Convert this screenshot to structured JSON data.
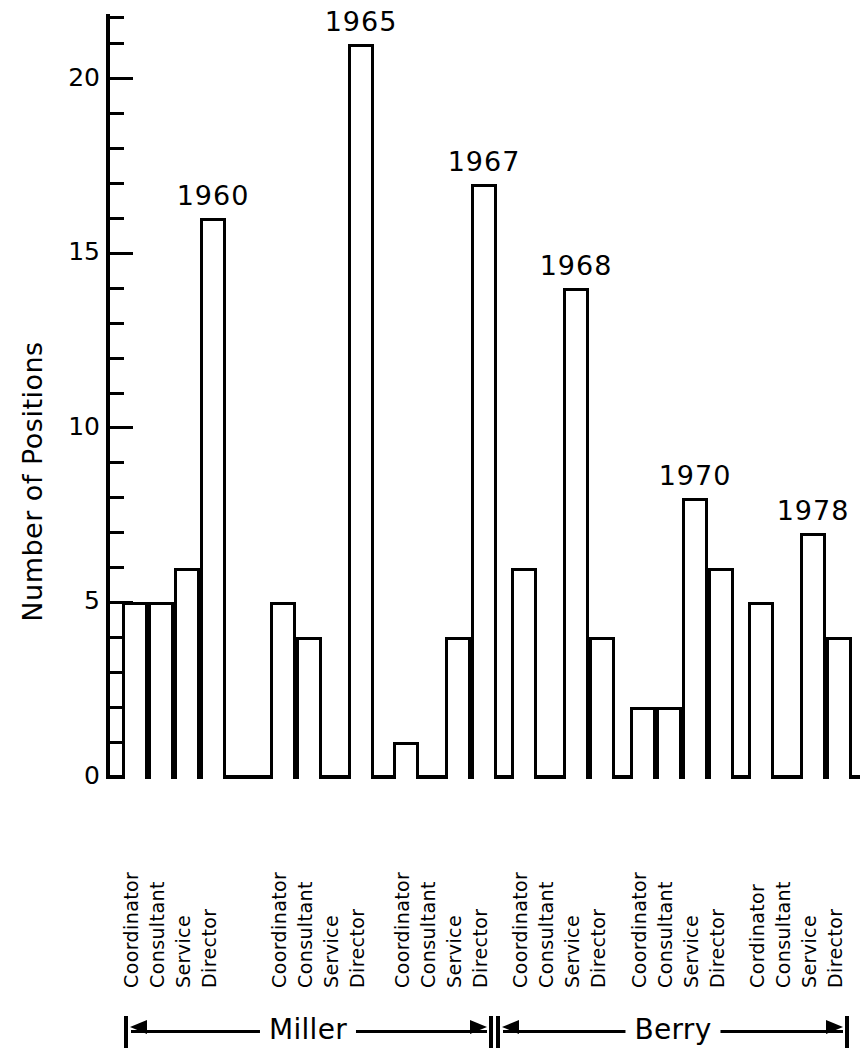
{
  "chart_data": {
    "type": "bar",
    "title": "",
    "xlabel": "",
    "ylabel": "Number of Positions",
    "ylim": [
      0,
      21.8
    ],
    "yticks": [
      0,
      5,
      10,
      15,
      20
    ],
    "ytick_labels": [
      "0",
      "5",
      "10",
      "15",
      "20"
    ],
    "minor_tick_interval": 1,
    "grid": false,
    "legend": false,
    "categories": [
      "Coordinator",
      "Consultant",
      "Service",
      "Director"
    ],
    "groups": [
      {
        "year": "1960",
        "study": "Miller",
        "categories": [
          "Coordinator",
          "Consultant",
          "Service",
          "Director"
        ],
        "values": [
          5,
          5,
          6,
          16
        ]
      },
      {
        "year": "1965",
        "study": "Miller",
        "categories": [
          "Coordinator",
          "Consultant",
          "Service",
          "Director"
        ],
        "values": [
          5,
          4,
          0,
          21
        ]
      },
      {
        "year": "1967",
        "study": "Miller",
        "categories": [
          "Coordinator",
          "Consultant",
          "Service",
          "Director"
        ],
        "values": [
          1,
          0,
          4,
          17
        ]
      },
      {
        "year": "1968",
        "study": "Berry",
        "categories": [
          "Coordinator",
          "Consultant",
          "Service",
          "Director"
        ],
        "values": [
          6,
          0,
          14,
          4
        ]
      },
      {
        "year": "1970",
        "study": "Berry",
        "categories": [
          "Coordinator",
          "Consultant",
          "Service",
          "Director"
        ],
        "values": [
          2,
          2,
          8,
          6
        ]
      },
      {
        "year": "1978",
        "study": "Berry",
        "categories": [
          "Cordinator",
          "Consultant",
          "Service",
          "Director"
        ],
        "values": [
          5,
          0,
          7,
          4
        ]
      }
    ],
    "spans": [
      {
        "label": "Miller",
        "groups": [
          "1960",
          "1965",
          "1967"
        ]
      },
      {
        "label": "Berry",
        "groups": [
          "1968",
          "1970",
          "1978"
        ]
      }
    ],
    "colors": {
      "bar_fill": "#ffffff",
      "bar_stroke": "#000000",
      "axis": "#000000",
      "background": "#ffffff"
    }
  },
  "axis": {
    "ylabel": "Number of Positions",
    "ytick_labels": [
      "20",
      "15",
      "10",
      "5",
      "0"
    ]
  },
  "years": {
    "g0": "1960",
    "g1": "1965",
    "g2": "1967",
    "g3": "1968",
    "g4": "1970",
    "g5": "1978"
  },
  "cats": {
    "coordinator": "Coordinator",
    "coordinator_alt": "Cordinator",
    "consultant": "Consultant",
    "service": "Service",
    "director": "Director"
  },
  "spans": {
    "miller": "Miller",
    "berry": "Berry"
  }
}
